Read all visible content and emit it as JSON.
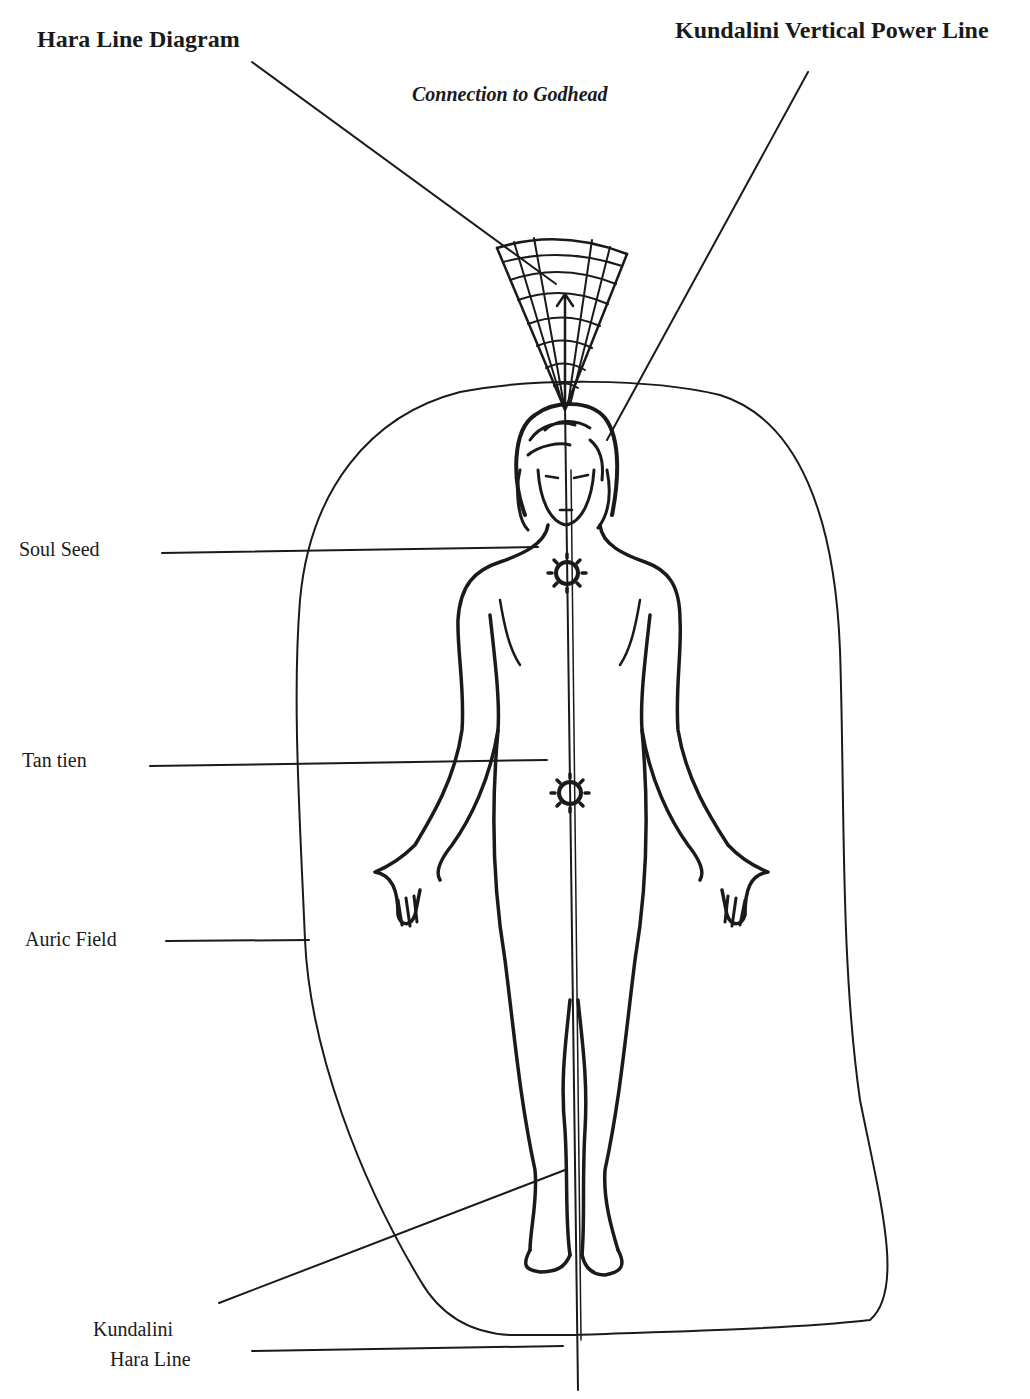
{
  "diagram": {
    "title": "Hara Line Diagram",
    "top_right_label": "Kundalini Vertical Power Line",
    "top_center_label": "Connection to Godhead",
    "callouts": {
      "soul_seed": "Soul Seed",
      "tan_tien": "Tan tien",
      "auric_field": "Auric Field",
      "kundalini_line1": "Kundalini",
      "kundalini_line2": "Hara Line"
    },
    "ink_color": "#1a1a1a",
    "background": "#ffffff"
  }
}
